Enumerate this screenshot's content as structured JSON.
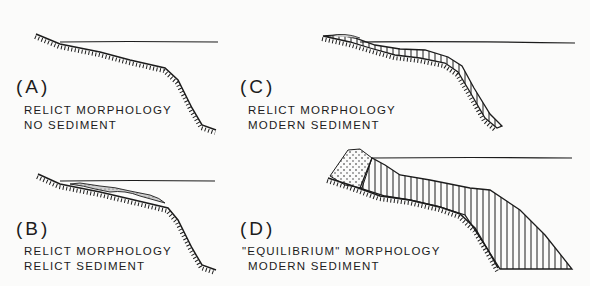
{
  "figure": {
    "panels": [
      {
        "id": "A",
        "letter": "(A)",
        "line1": "RELICT MORPHOLOGY",
        "line2": "NO SEDIMENT"
      },
      {
        "id": "B",
        "letter": "(B)",
        "line1": "RELICT  MORPHOLOGY",
        "line2": "RELICT  SEDIMENT"
      },
      {
        "id": "C",
        "letter": "(C)",
        "line1": "RELICT MORPHOLOGY",
        "line2": "MODERN  SEDIMENT"
      },
      {
        "id": "D",
        "letter": "(D)",
        "line1": "\"EQUILIBRIUM\"  MORPHOLOGY",
        "line2": "MODERN  SEDIMENT"
      }
    ]
  },
  "colors": {
    "ink": "#1c1c1c",
    "background": "#fbfbfa"
  }
}
